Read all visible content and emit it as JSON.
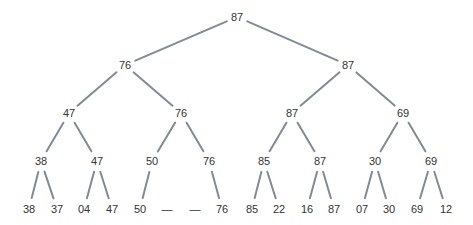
{
  "diagram": {
    "type": "tournament-tree",
    "edge_color": "#7f8c95",
    "text_color": "#333333",
    "levels": [
      [
        {
          "label": "87",
          "x": 237,
          "y": 17
        }
      ],
      [
        {
          "label": "76",
          "x": 125,
          "y": 65
        },
        {
          "label": "87",
          "x": 348,
          "y": 65
        }
      ],
      [
        {
          "label": "47",
          "x": 69,
          "y": 113
        },
        {
          "label": "76",
          "x": 181,
          "y": 113
        },
        {
          "label": "87",
          "x": 292,
          "y": 113
        },
        {
          "label": "69",
          "x": 403,
          "y": 113
        }
      ],
      [
        {
          "label": "38",
          "x": 41,
          "y": 161
        },
        {
          "label": "47",
          "x": 97,
          "y": 161
        },
        {
          "label": "50",
          "x": 152,
          "y": 161
        },
        {
          "label": "76",
          "x": 209,
          "y": 161
        },
        {
          "label": "85",
          "x": 264,
          "y": 161
        },
        {
          "label": "87",
          "x": 320,
          "y": 161
        },
        {
          "label": "30",
          "x": 375,
          "y": 161
        },
        {
          "label": "69",
          "x": 431,
          "y": 161
        }
      ],
      [
        {
          "label": "38",
          "x": 29,
          "y": 209
        },
        {
          "label": "37",
          "x": 57,
          "y": 209
        },
        {
          "label": "04",
          "x": 84,
          "y": 209
        },
        {
          "label": "47",
          "x": 112,
          "y": 209
        },
        {
          "label": "50",
          "x": 140,
          "y": 209
        },
        {
          "label": "—",
          "x": 167,
          "y": 209
        },
        {
          "label": "—",
          "x": 195,
          "y": 209
        },
        {
          "label": "76",
          "x": 222,
          "y": 209
        },
        {
          "label": "85",
          "x": 252,
          "y": 209
        },
        {
          "label": "22",
          "x": 279,
          "y": 209
        },
        {
          "label": "16",
          "x": 307,
          "y": 209
        },
        {
          "label": "87",
          "x": 334,
          "y": 209
        },
        {
          "label": "07",
          "x": 362,
          "y": 209
        },
        {
          "label": "30",
          "x": 389,
          "y": 209
        },
        {
          "label": "69",
          "x": 417,
          "y": 209
        },
        {
          "label": "12",
          "x": 446,
          "y": 209
        }
      ]
    ],
    "empty_leaves": [
      5,
      6
    ]
  }
}
